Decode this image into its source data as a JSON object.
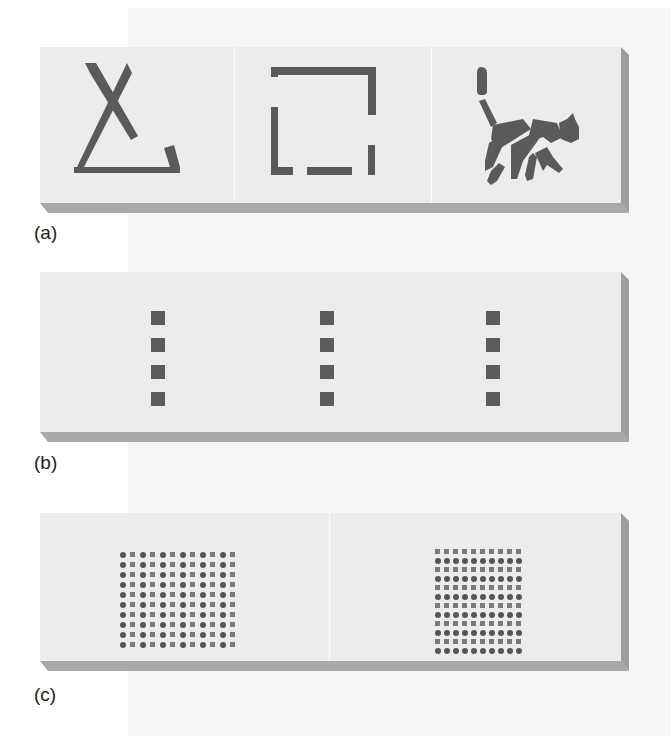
{
  "figure": {
    "panels": [
      {
        "id": "a",
        "label": "(a)",
        "description": "Closure: incomplete figures perceived as whole",
        "tiles": [
          {
            "shape": "broken-triangle"
          },
          {
            "shape": "broken-square"
          },
          {
            "shape": "segmented-cat-silhouette"
          }
        ]
      },
      {
        "id": "b",
        "label": "(b)",
        "description": "Proximity/similarity: three vertical columns of four squares",
        "columns": 3,
        "squares_per_column": 4
      },
      {
        "id": "c",
        "label": "(c)",
        "description": "Similarity grouping in dot matrices",
        "grids": [
          {
            "rows": 10,
            "cols": 12,
            "alternation": "columns",
            "pattern": [
              "circle",
              "square"
            ]
          },
          {
            "rows": 12,
            "cols": 10,
            "alternation": "rows",
            "pattern": [
              "square",
              "circle"
            ]
          }
        ]
      }
    ],
    "colors": {
      "panel_face": "#ececec",
      "panel_edge": "#a9a9a9",
      "ink": "#5a5a5a",
      "page_background": "#f6f6f6"
    }
  }
}
